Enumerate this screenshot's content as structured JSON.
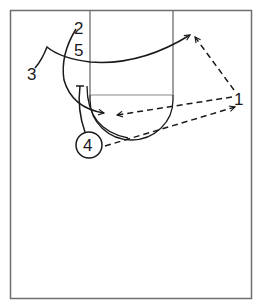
{
  "diagram": {
    "type": "basketball-play",
    "colors": {
      "court_line": "#6e6e6e",
      "ink": "#1a1a1a",
      "background": "#ffffff"
    },
    "players": [
      {
        "id": "1",
        "label": "1",
        "x": 240,
        "y": 105
      },
      {
        "id": "2",
        "label": "2",
        "x": 79,
        "y": 33
      },
      {
        "id": "3",
        "label": "3",
        "x": 33,
        "y": 79
      },
      {
        "id": "4",
        "label": "4",
        "x": 89,
        "y": 151,
        "circled": true
      },
      {
        "id": "5",
        "label": "5",
        "x": 80,
        "y": 55
      }
    ],
    "actions": [
      {
        "from": "3",
        "kind": "cut",
        "style": "solid",
        "end": "arrow"
      },
      {
        "from": "2",
        "kind": "cut",
        "style": "solid",
        "end": "arrow"
      },
      {
        "from": "4",
        "kind": "screen",
        "style": "solid",
        "end": "bar"
      },
      {
        "from": "5",
        "kind": "roll",
        "style": "solid",
        "end": "none"
      },
      {
        "from": "1",
        "kind": "pass",
        "style": "dashed",
        "end": "arrow",
        "to": "top-right"
      },
      {
        "from": "1",
        "kind": "pass",
        "style": "dashed",
        "end": "arrow",
        "to": "lane"
      },
      {
        "from": "4",
        "kind": "pass",
        "style": "dashed",
        "end": "arrow",
        "to": "1"
      }
    ]
  }
}
